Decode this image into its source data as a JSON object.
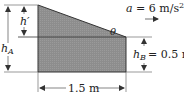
{
  "diagram": {
    "acceleration": {
      "symbol": "a",
      "value": "6",
      "unit": "m/s",
      "unit_power": "2",
      "full": "a = 6 m/s²"
    },
    "labels": {
      "h_prime": "h′",
      "h_A_main": "h",
      "h_A_sub": "A",
      "h_B_main": "h",
      "h_B_sub": "B",
      "h_B_value": "= 0.5 m",
      "theta": "θ",
      "width": "1.5 m"
    },
    "colors": {
      "fluid_fill": "#8f8f8f",
      "line": "#333333",
      "text": "#222222"
    }
  }
}
